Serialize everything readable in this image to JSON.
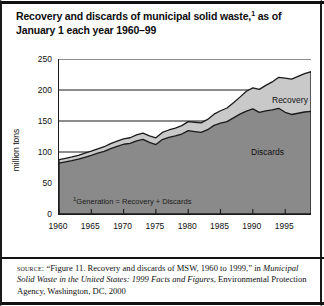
{
  "figure": {
    "title_line1": "Recovery and discards of municipal solid waste,",
    "title_sup": "1",
    "title_line1_tail": " as of",
    "title_line2": "January 1 each year 1960–99",
    "plot_footnote_sup": "1",
    "plot_footnote": "Generation = Recovery + Discards"
  },
  "source": {
    "label": "source:",
    "text_part1": " “Figure 11. Recovery and discards of MSW, 1960 to 1999,” in ",
    "italic_title": "Municipal Solid Waste in the United States: 1999 Facts and Figures",
    "text_part2": ", Environmental Protection Agency, Washington, DC, 2000"
  },
  "colors": {
    "discards_fill": "#8a8a8a",
    "recovery_fill": "#c9c9c9",
    "outline": "#1a1a1a",
    "gridline": "#1a1a1a",
    "axis": "#1a1a1a",
    "background": "#ffffff",
    "text": "#111111"
  },
  "chart_data": {
    "type": "area",
    "xlabel": "",
    "ylabel": "million tons",
    "xlim": [
      1960,
      1999
    ],
    "ylim": [
      0,
      250
    ],
    "ytick_values": [
      0,
      50,
      100,
      150,
      200,
      250
    ],
    "ytick_labels": [
      "0",
      "50",
      "100",
      "150",
      "200",
      "250"
    ],
    "xtick_values": [
      1960,
      1965,
      1970,
      1975,
      1980,
      1985,
      1990,
      1995
    ],
    "xtick_labels": [
      "1960",
      "1965",
      "1970",
      "1975",
      "1980",
      "1985",
      "1990",
      "1995"
    ],
    "grid": true,
    "grid_axis": "y",
    "stacked": true,
    "legend_position": "inline-annotations",
    "x": [
      1960,
      1961,
      1962,
      1963,
      1964,
      1965,
      1966,
      1967,
      1968,
      1969,
      1970,
      1971,
      1972,
      1973,
      1974,
      1975,
      1976,
      1977,
      1978,
      1979,
      1980,
      1981,
      1982,
      1983,
      1984,
      1985,
      1986,
      1987,
      1988,
      1989,
      1990,
      1991,
      1992,
      1993,
      1994,
      1995,
      1996,
      1997,
      1998,
      1999
    ],
    "series": [
      {
        "name": "Discards",
        "values": [
          82.1,
          84.0,
          86.0,
          88.5,
          91.5,
          94.5,
          98.0,
          101.0,
          105.5,
          109.0,
          112.5,
          114.0,
          118.0,
          120.5,
          115.5,
          112.0,
          120.0,
          123.5,
          126.0,
          129.0,
          134.5,
          133.0,
          131.5,
          136.0,
          143.0,
          146.5,
          149.0,
          155.0,
          161.0,
          166.0,
          169.5,
          164.0,
          166.5,
          168.0,
          170.5,
          164.0,
          160.5,
          162.5,
          164.5,
          165.5
        ]
      },
      {
        "name": "Recovery",
        "values": [
          5.6,
          5.8,
          6.0,
          6.2,
          6.5,
          6.8,
          7.2,
          7.5,
          8.0,
          8.5,
          8.6,
          9.0,
          9.5,
          10.0,
          10.5,
          10.8,
          11.5,
          12.0,
          12.5,
          13.5,
          14.5,
          15.0,
          15.5,
          16.5,
          18.0,
          20.0,
          22.0,
          24.5,
          27.5,
          32.0,
          34.0,
          37.0,
          41.0,
          45.0,
          50.0,
          55.0,
          57.0,
          59.5,
          62.0,
          64.0
        ]
      }
    ],
    "annotations": [
      {
        "text": "Recovery",
        "x": 1994,
        "y": 190
      },
      {
        "text": "Discards",
        "x": 1991,
        "y": 105
      },
      {
        "text": "¹Generation = Recovery + Discards",
        "x": 1962,
        "y": 22
      }
    ]
  }
}
